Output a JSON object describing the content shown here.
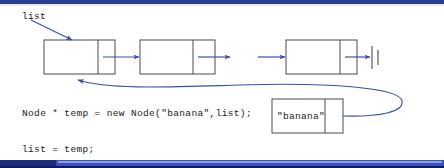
{
  "slide": {
    "width": 444,
    "height": 168,
    "background": "#ffffff",
    "accent_dark": "#1b2a7a",
    "accent_light": "#3a52bb",
    "top_rule_color": "#2b3d91",
    "line_color": "#3b4fa8",
    "box_border_color": "#4a4a4a",
    "text_color": "#1a1a1a"
  },
  "labels": {
    "list_pointer": "list",
    "banana_value": "\"banana\""
  },
  "code": {
    "line1": "Node * temp = new Node(\"banana\",list);",
    "line2": "list = temp;"
  },
  "nodes": [
    {
      "id": "node-1",
      "x": 44,
      "y": 40,
      "w": 71,
      "h": 34,
      "split": 54
    },
    {
      "id": "node-2",
      "x": 140,
      "y": 40,
      "w": 75,
      "h": 34,
      "split": 53
    },
    {
      "id": "node-3",
      "x": 286,
      "y": 40,
      "w": 71,
      "h": 34,
      "split": 54
    },
    {
      "id": "node-temp",
      "x": 272,
      "y": 99,
      "w": 71,
      "h": 34,
      "split": 53
    }
  ],
  "connectors": [
    {
      "name": "list-label-arrow",
      "from": "list label",
      "to": "node-1 top"
    },
    {
      "name": "node1-to-node2",
      "from": "node-1 next",
      "to": "node-2"
    },
    {
      "name": "node2-to-node3",
      "from": "node-2 next",
      "to": "node-3"
    },
    {
      "name": "node3-to-null",
      "from": "node-3 next",
      "to": "null terminator"
    },
    {
      "name": "temp-next-to-node1",
      "from": "node-temp next",
      "to": "node-1"
    }
  ],
  "null_terminator": {
    "x": 371,
    "y": 47,
    "height": 22
  }
}
